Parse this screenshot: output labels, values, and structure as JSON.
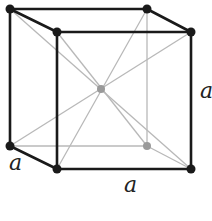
{
  "diagram": {
    "colors": {
      "edge": "#1a1a1a",
      "diagonal": "#b8b8b8",
      "hidden_atom": "#9a9a9a",
      "atom": "#1a1a1a"
    },
    "vertices": {
      "back_top_left": [
        10,
        9
      ],
      "back_top_right": [
        147,
        9
      ],
      "back_bottom_left": [
        10,
        146
      ],
      "back_bottom_right": [
        147,
        146
      ],
      "front_top_left": [
        57,
        32
      ],
      "front_top_right": [
        191,
        32
      ],
      "front_bottom_left": [
        57,
        169
      ],
      "front_bottom_right": [
        191,
        169
      ],
      "center": [
        101,
        89
      ]
    },
    "labels": {
      "depth": "a",
      "width": "a",
      "height": "a"
    }
  }
}
